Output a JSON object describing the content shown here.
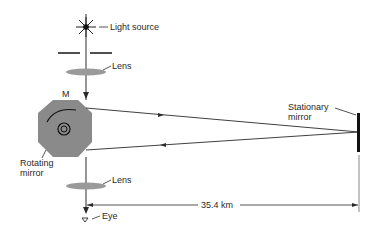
{
  "diagram": {
    "labels": {
      "light_source": "Light source",
      "lens_top": "Lens",
      "mirror_letter": "M",
      "rotating_mirror_line1": "Rotating",
      "rotating_mirror_line2": "mirror",
      "stationary_mirror_line1": "Stationary",
      "stationary_mirror_line2": "mirror",
      "lens_bottom": "Lens",
      "eye": "Eye",
      "distance": "35.4 km"
    },
    "colors": {
      "line": "#2a2a2a",
      "mirror_fill": "#8a8a8a",
      "lens_fill": "#9a9a9a",
      "background": "#ffffff"
    }
  }
}
